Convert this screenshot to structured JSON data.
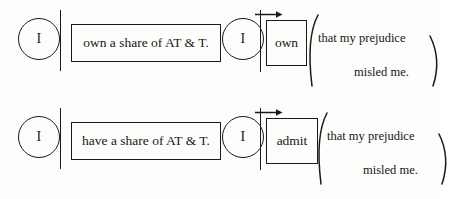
{
  "figure": {
    "type": "linguistic-tree-diagram",
    "ink_color": "#1a1a1a",
    "background_color": "#fdfdfc",
    "rows": [
      {
        "id": "row-sentence-1",
        "subject_label": "I",
        "predicate_label": "own a share of AT & T.",
        "reduced_subject_label": "I",
        "reduced_predicate_label": "own",
        "complement_line_1": "that my prejudice",
        "complement_line_2": "misled me."
      },
      {
        "id": "row-sentence-2",
        "subject_label": "I",
        "predicate_label": "have a share of AT & T.",
        "reduced_subject_label": "I",
        "reduced_predicate_label": "admit",
        "complement_line_1": "that my prejudice",
        "complement_line_2": "misled me."
      }
    ]
  },
  "icons": {
    "arrow_right": "arrow-right-icon",
    "paren_left": "left-parenthesis-icon",
    "paren_right": "right-parenthesis-icon",
    "divider": "vertical-divider-icon",
    "circle": "subject-circle-icon"
  }
}
